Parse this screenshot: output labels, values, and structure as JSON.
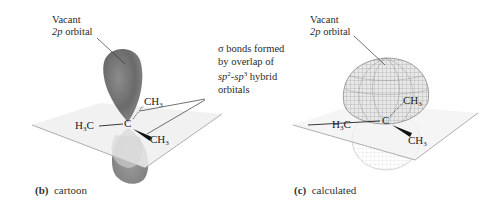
{
  "figure_b": {
    "label_letter": "(b)",
    "label_text": "cartoon",
    "vacant_label_line1": "Vacant",
    "vacant_label_line2_italic": "2p",
    "vacant_label_line2_rest": " orbital",
    "atoms": {
      "center": "C",
      "left": "H",
      "left_sub": "3",
      "left_tail": "C",
      "upper_right": "CH",
      "upper_right_sub": "3",
      "lower_right": "CH",
      "lower_right_sub": "3"
    }
  },
  "sigma_annotation": {
    "line1": "σ bonds formed",
    "line2": "by overlap of",
    "line3_a": "sp",
    "line3_a_sup": "2",
    "line3_dash": "-",
    "line3_b": "sp",
    "line3_b_sup": "3",
    "line3_rest": " hybrid",
    "line4": "orbitals"
  },
  "figure_c": {
    "label_letter": "(c)",
    "label_text": "calculated",
    "vacant_label_line1": "Vacant",
    "vacant_label_line2_italic": "2p",
    "vacant_label_line2_rest": " orbital",
    "atoms": {
      "center": "C",
      "left": "H",
      "left_sub": "3",
      "left_tail": "C",
      "upper_right": "CH",
      "upper_right_sub": "3",
      "lower_right": "CH",
      "lower_right_sub": "3"
    }
  },
  "colors": {
    "lobe_dark": "#6e6e6e",
    "lobe_light": "#bdbdbd",
    "plane_edge": "#9a9a9a",
    "mesh": "#8a8a8a"
  }
}
